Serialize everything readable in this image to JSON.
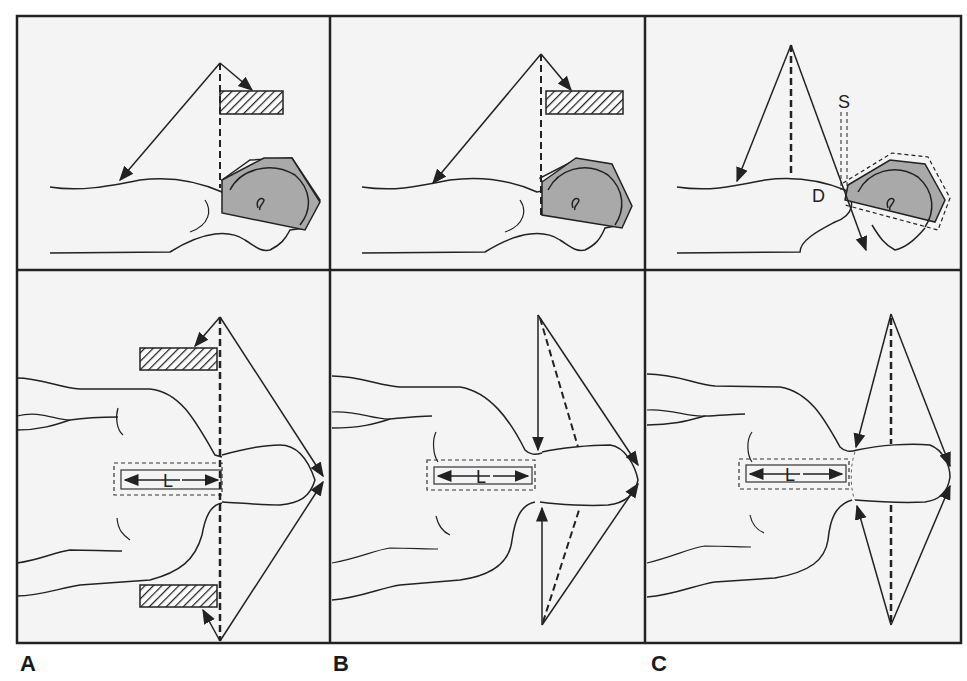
{
  "figure": {
    "panel_labels": [
      "A",
      "B",
      "C"
    ],
    "columns": [
      {
        "id": "A",
        "label": "A",
        "description": "Half-beam block technique with shields"
      },
      {
        "id": "B",
        "label": "B",
        "description": "Angled fields without shields"
      },
      {
        "id": "C",
        "label": "C",
        "description": "Angled fields with gap S and depth D"
      }
    ],
    "annotations": {
      "length_label": "L",
      "gap_label": "S",
      "depth_label": "D"
    },
    "colors": {
      "line": "#222222",
      "background": "#f4f4f4",
      "field_fill": "#a9a9a9",
      "border": "#333333"
    }
  }
}
